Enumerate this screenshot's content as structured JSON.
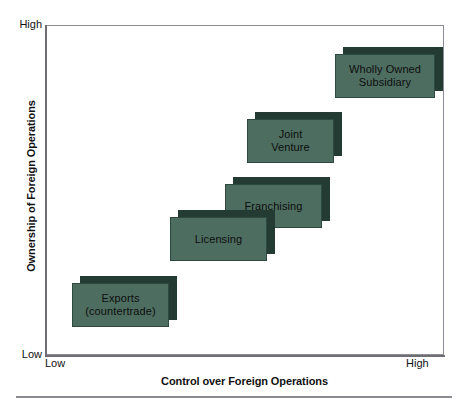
{
  "figure": {
    "top_artifact_text": "",
    "bottom_rule": "horizontal-rule"
  },
  "axes": {
    "y": {
      "title": "Ownership of Foreign Operations",
      "low_label": "Low",
      "high_label": "High"
    },
    "x": {
      "title": "Control over Foreign Operations",
      "low_label": "Low",
      "high_label": "High"
    }
  },
  "colors": {
    "box_face": "#4d6d61",
    "box_shadow": "#243b33",
    "box_border": "#2d4a40",
    "frame": "#8d8d93",
    "text": "#111111"
  },
  "chart_data": {
    "type": "scatter",
    "title": "",
    "xlabel": "Control over Foreign Operations",
    "ylabel": "Ownership of Foreign Operations",
    "xlim": [
      "Low",
      "High"
    ],
    "ylim": [
      "Low",
      "High"
    ],
    "grid": false,
    "legend": "none",
    "note": "Conceptual positioning diagram: foreign market entry modes ordered along an ascending diagonal of increasing control and increasing ownership.",
    "categories": [
      "Exports (countertrade)",
      "Licensing",
      "Franchising",
      "Joint Venture",
      "Wholly Owned Subsidiary"
    ],
    "points": [
      {
        "label": "Exports\n(countertrade)",
        "control": 1,
        "ownership": 1,
        "order": 1
      },
      {
        "label": "Licensing",
        "control": 2,
        "ownership": 2,
        "order": 2
      },
      {
        "label": "Franchising",
        "control": 3,
        "ownership": 3,
        "order": 3
      },
      {
        "label": "Joint\nVenture",
        "control": 4,
        "ownership": 4,
        "order": 4
      },
      {
        "label": "Wholly Owned\nSubsidiary",
        "control": 5,
        "ownership": 5,
        "order": 5
      }
    ]
  },
  "boxes": {
    "exports": {
      "label": "Exports\n(countertrade)"
    },
    "licensing": {
      "label": "Licensing"
    },
    "franchising": {
      "label": "Franchising"
    },
    "joint": {
      "label": "Joint\nVenture"
    },
    "wholly": {
      "label": "Wholly Owned\nSubsidiary"
    }
  }
}
